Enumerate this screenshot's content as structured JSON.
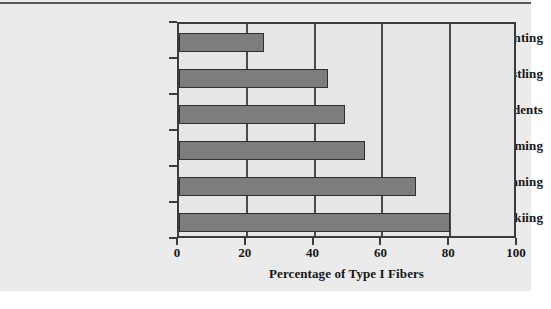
{
  "chart_data": {
    "type": "bar",
    "orientation": "horizontal",
    "title": "",
    "subtitle": "",
    "xlabel": "Percentage of Type I Fibers",
    "ylabel": "",
    "categories": [
      "Sprinting",
      "Wrestling",
      "Trained Students",
      "Swimming",
      "Marathon Running",
      "Cross Country Skiing"
    ],
    "values": [
      25,
      44,
      49,
      55,
      70,
      80
    ],
    "xlim": [
      0,
      100
    ],
    "xticks": [
      0,
      20,
      40,
      60,
      80,
      100
    ],
    "xtick_labels": [
      "0",
      "20",
      "40",
      "60",
      "80",
      "100"
    ],
    "grid": "vertical",
    "legend": "none",
    "bar_color": "#7d7d7d",
    "bar_border_color": "#2e2e2e",
    "plot_background": "#e6e6e6",
    "axis_color": "#3c3c3c",
    "page_background": "#ebebeb",
    "annotations": []
  }
}
